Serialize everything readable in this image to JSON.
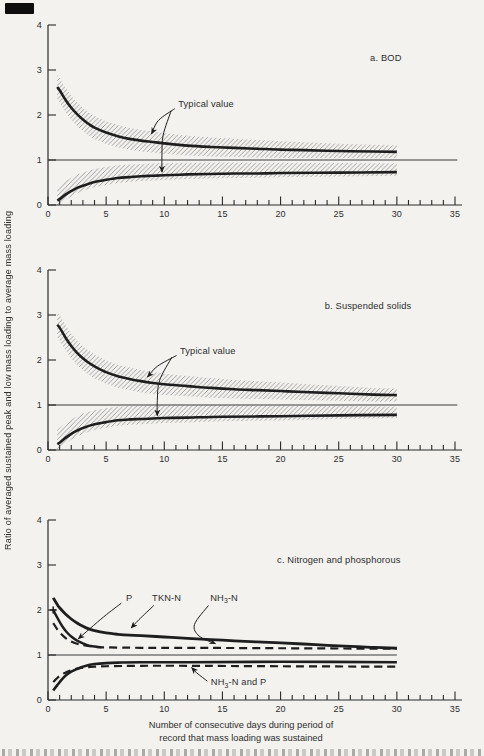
{
  "colors": {
    "paper": "#f3f2ef",
    "ink": "#1e1e1e",
    "axis": "#2a2a2a",
    "text": "#2d2d2d",
    "hatch": "#969696",
    "reference": "#3a3a3a"
  },
  "figure": {
    "y_axis_label": "Ratio of averaged sustained peak and low mass loading to average mass loading",
    "x_axis_label": [
      "Number of consecutive days during period of",
      "record that mass loading was sustained"
    ]
  },
  "chart_data": [
    {
      "type": "line",
      "panel": "a",
      "panel_label": "a. BOD",
      "xlim": [
        0,
        35
      ],
      "ylim": [
        0,
        4
      ],
      "xticks_major": [
        0,
        5,
        10,
        15,
        20,
        25,
        30,
        35
      ],
      "xtick_minor_step": 1,
      "yticks": [
        0,
        1,
        2,
        3,
        4
      ],
      "grid": false,
      "reference_line_y": 1,
      "reference_line_xend": 35.2,
      "series": [
        {
          "id": "peak",
          "name": "sustained peak ratio",
          "style": "solid",
          "width": 2.6,
          "band": {
            "start": 0.27,
            "end": 0.14,
            "topScale": 1,
            "botScale": 1
          },
          "points": [
            [
              0.8,
              2.62
            ],
            [
              1,
              2.55
            ],
            [
              1.5,
              2.34
            ],
            [
              2,
              2.16
            ],
            [
              2.5,
              2.02
            ],
            [
              3,
              1.9
            ],
            [
              3.5,
              1.8
            ],
            [
              4,
              1.72
            ],
            [
              5,
              1.61
            ],
            [
              6,
              1.53
            ],
            [
              7,
              1.47
            ],
            [
              8,
              1.43
            ],
            [
              9,
              1.4
            ],
            [
              10,
              1.37
            ],
            [
              12,
              1.32
            ],
            [
              14,
              1.29
            ],
            [
              16,
              1.27
            ],
            [
              18,
              1.25
            ],
            [
              20,
              1.23
            ],
            [
              22,
              1.22
            ],
            [
              25,
              1.2
            ],
            [
              28,
              1.19
            ],
            [
              30,
              1.18
            ]
          ]
        },
        {
          "id": "low",
          "name": "sustained low ratio",
          "style": "solid",
          "width": 2.6,
          "band": {
            "start": 0.2,
            "end": 0.13,
            "topScale": 1.5,
            "botScale": 0.6
          },
          "points": [
            [
              0.8,
              0.1
            ],
            [
              1,
              0.13
            ],
            [
              1.5,
              0.23
            ],
            [
              2,
              0.31
            ],
            [
              2.5,
              0.38
            ],
            [
              3,
              0.43
            ],
            [
              3.5,
              0.47
            ],
            [
              4,
              0.51
            ],
            [
              5,
              0.56
            ],
            [
              6,
              0.6
            ],
            [
              7,
              0.62
            ],
            [
              8,
              0.64
            ],
            [
              9,
              0.65
            ],
            [
              10,
              0.66
            ],
            [
              12,
              0.68
            ],
            [
              14,
              0.69
            ],
            [
              16,
              0.7
            ],
            [
              18,
              0.7
            ],
            [
              20,
              0.71
            ],
            [
              25,
              0.72
            ],
            [
              30,
              0.73
            ]
          ]
        }
      ],
      "annotations": [
        {
          "id": "panel-label",
          "text": "a. BOD",
          "x": 27.7,
          "y": 3.2
        },
        {
          "id": "typical-value",
          "text": "Typical value",
          "x": 11.2,
          "y": 2.18
        }
      ],
      "arrows": [
        {
          "id": "typical-to-peak",
          "points": [
            [
              10.9,
              2.14
            ],
            [
              9.5,
              1.88
            ],
            [
              8.9,
              1.58
            ]
          ]
        },
        {
          "id": "typical-to-low",
          "points": [
            [
              10.6,
              2.1
            ],
            [
              9.9,
              1.55
            ],
            [
              9.8,
              1.1
            ],
            [
              9.8,
              0.73
            ]
          ]
        }
      ]
    },
    {
      "type": "line",
      "panel": "b",
      "panel_label": "b. Suspended solids",
      "xlim": [
        0,
        35
      ],
      "ylim": [
        0,
        4
      ],
      "xticks_major": [
        0,
        5,
        10,
        15,
        20,
        25,
        30,
        35
      ],
      "xtick_minor_step": 1,
      "yticks": [
        0,
        1,
        2,
        3,
        4
      ],
      "grid": false,
      "reference_line_y": 1,
      "reference_line_xend": 35.2,
      "series": [
        {
          "id": "peak",
          "name": "sustained peak ratio",
          "style": "solid",
          "width": 2.6,
          "band": {
            "start": 0.28,
            "end": 0.14,
            "topScale": 1,
            "botScale": 1
          },
          "points": [
            [
              0.8,
              2.78
            ],
            [
              1,
              2.72
            ],
            [
              1.5,
              2.5
            ],
            [
              2,
              2.31
            ],
            [
              2.5,
              2.16
            ],
            [
              3,
              2.04
            ],
            [
              3.5,
              1.94
            ],
            [
              4,
              1.86
            ],
            [
              5,
              1.73
            ],
            [
              6,
              1.64
            ],
            [
              7,
              1.58
            ],
            [
              8,
              1.53
            ],
            [
              9,
              1.49
            ],
            [
              10,
              1.46
            ],
            [
              12,
              1.42
            ],
            [
              14,
              1.38
            ],
            [
              16,
              1.35
            ],
            [
              18,
              1.33
            ],
            [
              20,
              1.31
            ],
            [
              22,
              1.29
            ],
            [
              25,
              1.26
            ],
            [
              28,
              1.23
            ],
            [
              30,
              1.22
            ]
          ]
        },
        {
          "id": "low",
          "name": "sustained low ratio",
          "style": "solid",
          "width": 2.6,
          "band": {
            "start": 0.22,
            "end": 0.12,
            "topScale": 1.5,
            "botScale": 0.6
          },
          "points": [
            [
              0.8,
              0.13
            ],
            [
              1,
              0.16
            ],
            [
              1.5,
              0.27
            ],
            [
              2,
              0.36
            ],
            [
              2.5,
              0.43
            ],
            [
              3,
              0.49
            ],
            [
              4,
              0.57
            ],
            [
              5,
              0.62
            ],
            [
              6,
              0.66
            ],
            [
              7,
              0.68
            ],
            [
              8,
              0.69
            ],
            [
              10,
              0.71
            ],
            [
              12,
              0.72
            ],
            [
              15,
              0.74
            ],
            [
              20,
              0.75
            ],
            [
              25,
              0.77
            ],
            [
              30,
              0.78
            ]
          ]
        }
      ],
      "annotations": [
        {
          "id": "panel-label",
          "text": "b. Suspended solids",
          "x": 23.8,
          "y": 3.13
        },
        {
          "id": "typical-value",
          "text": "Typical value",
          "x": 11.35,
          "y": 2.13
        }
      ],
      "arrows": [
        {
          "id": "typical-to-peak",
          "points": [
            [
              11.05,
              2.1
            ],
            [
              9.4,
              1.86
            ],
            [
              8.55,
              1.62
            ]
          ]
        },
        {
          "id": "typical-to-low",
          "points": [
            [
              10.65,
              2.06
            ],
            [
              9.6,
              1.55
            ],
            [
              9.4,
              1.1
            ],
            [
              9.4,
              0.76
            ]
          ]
        }
      ]
    },
    {
      "type": "line",
      "panel": "c",
      "panel_label": "c. Nitrogen and phosphorous",
      "xlim": [
        0,
        35
      ],
      "ylim": [
        0,
        4
      ],
      "xticks_major": [
        0,
        5,
        10,
        15,
        20,
        25,
        30,
        35
      ],
      "xtick_minor_step": 1,
      "yticks": [
        0,
        1,
        2,
        3,
        4
      ],
      "grid": false,
      "reference_line_y": 1,
      "reference_line_xend": 30,
      "series": [
        {
          "id": "tkn-n-peak",
          "name": "TKN-N peak",
          "style": "solid",
          "width": 2.8,
          "points": [
            [
              0.45,
              2.27
            ],
            [
              0.8,
              2.12
            ],
            [
              1,
              2.05
            ],
            [
              1.5,
              1.91
            ],
            [
              2,
              1.8
            ],
            [
              2.5,
              1.71
            ],
            [
              3,
              1.64
            ],
            [
              3.5,
              1.58
            ],
            [
              4,
              1.54
            ],
            [
              5,
              1.49
            ],
            [
              6,
              1.46
            ],
            [
              7,
              1.44
            ],
            [
              8,
              1.43
            ],
            [
              10,
              1.4
            ],
            [
              12,
              1.37
            ],
            [
              15,
              1.33
            ],
            [
              18,
              1.29
            ],
            [
              20,
              1.27
            ],
            [
              23,
              1.23
            ],
            [
              26,
              1.19
            ],
            [
              28,
              1.17
            ],
            [
              30,
              1.15
            ]
          ]
        },
        {
          "id": "p-peak",
          "name": "P peak",
          "style": "solid",
          "width": 2.4,
          "points": [
            [
              0.45,
              2.0
            ],
            [
              0.8,
              1.83
            ],
            [
              1.2,
              1.65
            ],
            [
              1.6,
              1.51
            ],
            [
              2,
              1.41
            ],
            [
              2.5,
              1.32
            ],
            [
              3,
              1.26
            ],
            [
              3.5,
              1.21
            ],
            [
              4,
              1.19
            ],
            [
              4.6,
              1.17
            ]
          ]
        },
        {
          "id": "nh3-n-peak",
          "name": "NH3-N peak",
          "style": "dashed",
          "width": 2.2,
          "points": [
            [
              0.45,
              1.71
            ],
            [
              0.8,
              1.57
            ],
            [
              1.2,
              1.45
            ],
            [
              1.6,
              1.36
            ],
            [
              2,
              1.3
            ],
            [
              2.5,
              1.25
            ],
            [
              3,
              1.22
            ],
            [
              4,
              1.18
            ],
            [
              5,
              1.17
            ],
            [
              8,
              1.16
            ],
            [
              12,
              1.16
            ],
            [
              20,
              1.15
            ],
            [
              30,
              1.14
            ]
          ]
        },
        {
          "id": "tkn-n-low",
          "name": "TKN-N low",
          "style": "solid",
          "width": 2.6,
          "points": [
            [
              0.45,
              0.21
            ],
            [
              0.8,
              0.33
            ],
            [
              1.2,
              0.46
            ],
            [
              1.6,
              0.56
            ],
            [
              2,
              0.63
            ],
            [
              2.5,
              0.69
            ],
            [
              3,
              0.74
            ],
            [
              3.5,
              0.78
            ],
            [
              4,
              0.8
            ],
            [
              5,
              0.82
            ],
            [
              6,
              0.83
            ],
            [
              8,
              0.84
            ],
            [
              12,
              0.84
            ],
            [
              20,
              0.85
            ],
            [
              30,
              0.84
            ]
          ]
        },
        {
          "id": "nh3-n-and-p-low",
          "name": "NH3-N and P low",
          "style": "dashed",
          "width": 2.2,
          "points": [
            [
              0.45,
              0.4
            ],
            [
              0.8,
              0.49
            ],
            [
              1.2,
              0.57
            ],
            [
              1.6,
              0.62
            ],
            [
              2,
              0.66
            ],
            [
              2.5,
              0.7
            ],
            [
              3,
              0.72
            ],
            [
              3.5,
              0.73
            ],
            [
              4,
              0.74
            ],
            [
              5,
              0.75
            ],
            [
              8,
              0.76
            ],
            [
              12,
              0.76
            ],
            [
              20,
              0.75
            ],
            [
              30,
              0.74
            ]
          ]
        }
      ],
      "annotations": [
        {
          "id": "panel-label",
          "text": "c. Nitrogen and phosphorous",
          "x": 19.7,
          "y": 3.05
        },
        {
          "id": "label-p",
          "text": "P",
          "x": 6.7,
          "y": 2.2
        },
        {
          "id": "label-tkn-n",
          "text": "TKN-N",
          "x": 8.95,
          "y": 2.2
        },
        {
          "id": "label-nh3-n",
          "text": [
            {
              "t": "NH"
            },
            {
              "t": "3",
              "sub": true
            },
            {
              "t": "-N"
            }
          ],
          "x": 13.95,
          "y": 2.2
        },
        {
          "id": "label-nh3-n-and-p",
          "text": [
            {
              "t": "NH"
            },
            {
              "t": "3",
              "sub": true
            },
            {
              "t": "-N and P"
            }
          ],
          "x": 14.0,
          "y": 0.33
        },
        {
          "id": "p-start-marker",
          "type": "cross",
          "x": 0.45,
          "y": 2.0
        }
      ],
      "arrows": [
        {
          "id": "leader-p",
          "points": [
            [
              6.3,
              2.15
            ],
            [
              4.8,
              1.85
            ],
            [
              2.6,
              1.36
            ]
          ]
        },
        {
          "id": "leader-tkn-n",
          "points": [
            [
              9.1,
              2.1
            ],
            [
              7.8,
              1.78
            ],
            [
              7.15,
              1.6
            ]
          ]
        },
        {
          "id": "leader-nh3-n",
          "points": [
            [
              13.8,
              2.1
            ],
            [
              12.6,
              1.68
            ],
            [
              13.0,
              1.42
            ],
            [
              14.4,
              1.25
            ]
          ]
        },
        {
          "id": "leader-nh3-n-and-p",
          "points": [
            [
              13.7,
              0.42
            ],
            [
              12.8,
              0.6
            ],
            [
              12.35,
              0.72
            ]
          ]
        }
      ]
    }
  ]
}
